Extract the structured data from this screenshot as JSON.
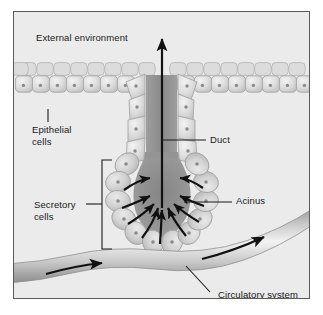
{
  "figure": {
    "kind": "biology-diagram",
    "background_color": "#ebebeb",
    "border_color": "#5a5a5a",
    "page_background": "#ffffff"
  },
  "labels": {
    "external_environment": "External environment",
    "epithelial_cells": "Epithelial\ncells",
    "duct": "Duct",
    "secretory_cells": "Secretory\ncells",
    "acinus": "Acinus",
    "circulatory_system": "Circulatory system"
  },
  "colors": {
    "cell_fill_light": "#e2e2e2",
    "cell_fill_mid": "#cfcfcf",
    "cell_outline": "#9a9a9a",
    "nucleus": "#8a8a8a",
    "lumen_dark": "#8f8f8f",
    "vessel_light": "#efefef",
    "vessel_mid": "#c4c4c4",
    "vessel_dark": "#8d8d8d",
    "arrow": "#111111",
    "leader_line": "#1a1a1a",
    "text": "#1a1a1a"
  },
  "annotations": {
    "duct_flow_arrow": "upward arrow through duct lumen toward external environment",
    "acinus_arrows": "radiating arrows converging into the acinar lumen",
    "vessel_arrows": "two arrows indicating blood flow direction to the right",
    "secretory_bracket": "vertical bracket spanning the acinar secretory cells"
  }
}
